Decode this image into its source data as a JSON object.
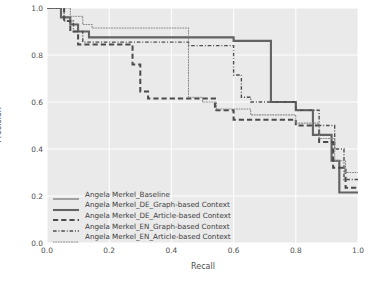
{
  "chart_data": {
    "type": "line",
    "title": "",
    "xlabel": "Recall",
    "ylabel": "Precision",
    "xlim": [
      0.0,
      1.0
    ],
    "ylim": [
      0.0,
      1.0
    ],
    "xticks": [
      "0.0",
      "0.2",
      "0.4",
      "0.6",
      "0.8",
      "1.0"
    ],
    "yticks": [
      "0.0",
      "0.2",
      "0.4",
      "0.6",
      "0.8",
      "1.0"
    ],
    "xtick_values": [
      0.0,
      0.2,
      0.4,
      0.6,
      0.8,
      1.0
    ],
    "ytick_values": [
      0.0,
      0.2,
      0.4,
      0.6,
      0.8,
      1.0
    ],
    "grid": true,
    "grid_color": "#ffffff",
    "plot_background": "#eaeaea",
    "legend_position": "lower left",
    "series": [
      {
        "name": "Angela Merkel_Baseline",
        "style": "solid",
        "width": 1.0,
        "color": "#5a5a5a",
        "points": [
          [
            0.0,
            1.0
          ],
          [
            0.045,
            1.0
          ],
          [
            0.045,
            0.96
          ],
          [
            0.075,
            0.96
          ],
          [
            0.075,
            0.93
          ],
          [
            0.1,
            0.93
          ],
          [
            0.1,
            0.9
          ],
          [
            0.135,
            0.9
          ],
          [
            0.135,
            0.875
          ],
          [
            0.6,
            0.875
          ],
          [
            0.6,
            0.86
          ],
          [
            0.72,
            0.86
          ],
          [
            0.72,
            0.6
          ],
          [
            0.8,
            0.6
          ],
          [
            0.8,
            0.565
          ],
          [
            0.855,
            0.565
          ],
          [
            0.855,
            0.46
          ],
          [
            0.915,
            0.46
          ],
          [
            0.915,
            0.35
          ],
          [
            0.94,
            0.35
          ],
          [
            0.94,
            0.215
          ],
          [
            1.0,
            0.215
          ]
        ]
      },
      {
        "name": "Angela Merkel_DE_Graph-based Context",
        "style": "solid-thick",
        "width": 2.1,
        "color": "#636363",
        "points": [
          [
            0.0,
            1.0
          ],
          [
            0.045,
            1.0
          ],
          [
            0.045,
            0.96
          ],
          [
            0.075,
            0.96
          ],
          [
            0.075,
            0.93
          ],
          [
            0.1,
            0.93
          ],
          [
            0.1,
            0.9
          ],
          [
            0.135,
            0.9
          ],
          [
            0.135,
            0.875
          ],
          [
            0.6,
            0.875
          ],
          [
            0.6,
            0.86
          ],
          [
            0.72,
            0.86
          ],
          [
            0.72,
            0.6
          ],
          [
            0.8,
            0.6
          ],
          [
            0.8,
            0.565
          ],
          [
            0.855,
            0.565
          ],
          [
            0.855,
            0.46
          ],
          [
            0.915,
            0.46
          ],
          [
            0.915,
            0.35
          ],
          [
            0.94,
            0.35
          ],
          [
            0.94,
            0.215
          ],
          [
            1.0,
            0.215
          ]
        ]
      },
      {
        "name": "Angela Merkel_DE_Article-based Context",
        "style": "dashed",
        "width": 2.0,
        "color": "#4a4a4a",
        "points": [
          [
            0.0,
            1.0
          ],
          [
            0.055,
            1.0
          ],
          [
            0.055,
            0.945
          ],
          [
            0.075,
            0.945
          ],
          [
            0.075,
            0.9
          ],
          [
            0.1,
            0.9
          ],
          [
            0.1,
            0.845
          ],
          [
            0.275,
            0.845
          ],
          [
            0.275,
            0.76
          ],
          [
            0.3,
            0.76
          ],
          [
            0.3,
            0.645
          ],
          [
            0.325,
            0.645
          ],
          [
            0.325,
            0.615
          ],
          [
            0.54,
            0.615
          ],
          [
            0.54,
            0.565
          ],
          [
            0.6,
            0.565
          ],
          [
            0.6,
            0.525
          ],
          [
            0.8,
            0.525
          ],
          [
            0.8,
            0.5
          ],
          [
            0.875,
            0.5
          ],
          [
            0.875,
            0.43
          ],
          [
            0.92,
            0.43
          ],
          [
            0.92,
            0.32
          ],
          [
            0.96,
            0.32
          ],
          [
            0.96,
            0.235
          ],
          [
            1.0,
            0.235
          ]
        ]
      },
      {
        "name": "Angela Merkel_EN_Graph-based Context",
        "style": "dashdot",
        "width": 1.4,
        "color": "#4f4f4f",
        "points": [
          [
            0.0,
            1.0
          ],
          [
            0.055,
            1.0
          ],
          [
            0.055,
            0.945
          ],
          [
            0.085,
            0.945
          ],
          [
            0.085,
            0.9
          ],
          [
            0.115,
            0.9
          ],
          [
            0.115,
            0.855
          ],
          [
            0.455,
            0.855
          ],
          [
            0.455,
            0.84
          ],
          [
            0.6,
            0.84
          ],
          [
            0.6,
            0.715
          ],
          [
            0.625,
            0.715
          ],
          [
            0.625,
            0.62
          ],
          [
            0.655,
            0.62
          ],
          [
            0.655,
            0.6
          ],
          [
            0.8,
            0.6
          ],
          [
            0.8,
            0.565
          ],
          [
            0.875,
            0.565
          ],
          [
            0.875,
            0.5
          ],
          [
            0.925,
            0.5
          ],
          [
            0.925,
            0.4
          ],
          [
            0.955,
            0.4
          ],
          [
            0.955,
            0.27
          ],
          [
            1.0,
            0.27
          ]
        ]
      },
      {
        "name": "Angela Merkel_EN_Article-based Context",
        "style": "dotted",
        "width": 1.1,
        "color": "#8a8a8a",
        "points": [
          [
            0.0,
            1.0
          ],
          [
            0.075,
            1.0
          ],
          [
            0.075,
            0.965
          ],
          [
            0.115,
            0.965
          ],
          [
            0.115,
            0.93
          ],
          [
            0.145,
            0.93
          ],
          [
            0.145,
            0.915
          ],
          [
            0.455,
            0.915
          ],
          [
            0.455,
            0.62
          ],
          [
            0.5,
            0.62
          ],
          [
            0.5,
            0.6
          ],
          [
            0.545,
            0.6
          ],
          [
            0.545,
            0.57
          ],
          [
            0.655,
            0.57
          ],
          [
            0.655,
            0.545
          ],
          [
            0.8,
            0.545
          ],
          [
            0.8,
            0.51
          ],
          [
            0.875,
            0.51
          ],
          [
            0.875,
            0.445
          ],
          [
            0.925,
            0.445
          ],
          [
            0.925,
            0.35
          ],
          [
            0.96,
            0.35
          ],
          [
            0.96,
            0.3
          ],
          [
            1.0,
            0.3
          ]
        ]
      }
    ]
  },
  "legend": {
    "items": [
      {
        "label": "Angela Merkel_Baseline",
        "style": "solid"
      },
      {
        "label": "Angela Merkel_DE_Graph-based Context",
        "style": "solid-thick"
      },
      {
        "label": "Angela Merkel_DE_Article-based Context",
        "style": "dashed"
      },
      {
        "label": "Angela Merkel_EN_Graph-based Context",
        "style": "dashdot"
      },
      {
        "label": "Angela Merkel_EN_Article-based Context",
        "style": "dotted"
      }
    ]
  }
}
